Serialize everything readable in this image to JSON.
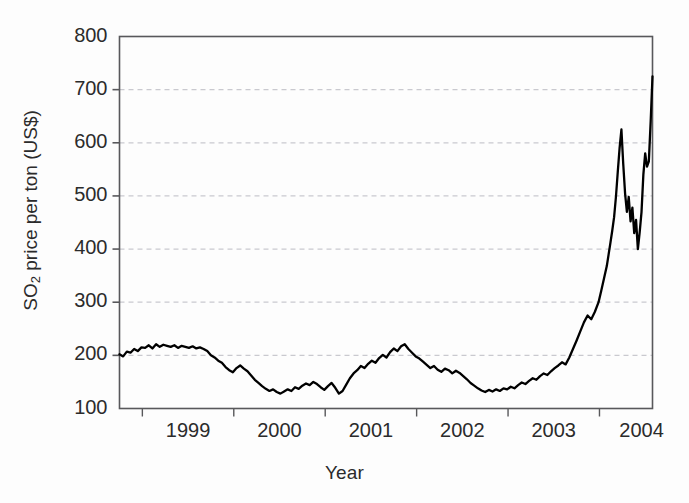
{
  "chart_data": {
    "type": "line",
    "title": "",
    "subtitle": "",
    "xlabel": "Year",
    "ylabel": "SO2 price per ton (US$)",
    "ylabel_parts": {
      "pre": "SO",
      "sub": "2",
      "post": " price per ton (US$)"
    },
    "xtick_labels": [
      "1999",
      "2000",
      "2001",
      "2002",
      "2003",
      "2004"
    ],
    "ytick_labels": [
      "100",
      "200",
      "300",
      "400",
      "500",
      "600",
      "700",
      "800"
    ],
    "ytick_values": [
      100,
      200,
      300,
      400,
      500,
      600,
      700,
      800
    ],
    "ylim": [
      100,
      800
    ],
    "xlim": [
      1998.75,
      2004.58
    ],
    "grid": "horizontal-dashed",
    "grid_values": [
      200,
      300,
      400,
      500,
      600,
      700
    ],
    "legend": "none",
    "series_name": "SO2 allowance price",
    "line_color": "#000000",
    "grid_color": "#c9c9cf",
    "axis_color": "#58585b",
    "x": [
      1998.75,
      1998.79,
      1998.83,
      1998.87,
      1998.91,
      1998.95,
      1998.99,
      1999.03,
      1999.07,
      1999.11,
      1999.15,
      1999.19,
      1999.23,
      1999.27,
      1999.31,
      1999.35,
      1999.39,
      1999.43,
      1999.47,
      1999.51,
      1999.55,
      1999.59,
      1999.63,
      1999.67,
      1999.71,
      1999.75,
      1999.79,
      1999.83,
      1999.87,
      1999.91,
      1999.95,
      1999.99,
      2000.03,
      2000.07,
      2000.11,
      2000.15,
      2000.19,
      2000.23,
      2000.27,
      2000.31,
      2000.35,
      2000.39,
      2000.43,
      2000.47,
      2000.51,
      2000.55,
      2000.59,
      2000.63,
      2000.67,
      2000.71,
      2000.75,
      2000.79,
      2000.83,
      2000.87,
      2000.91,
      2000.95,
      2000.99,
      2001.03,
      2001.07,
      2001.11,
      2001.15,
      2001.19,
      2001.23,
      2001.27,
      2001.31,
      2001.35,
      2001.39,
      2001.43,
      2001.47,
      2001.51,
      2001.55,
      2001.59,
      2001.63,
      2001.67,
      2001.71,
      2001.75,
      2001.79,
      2001.83,
      2001.87,
      2001.91,
      2001.95,
      2001.99,
      2002.03,
      2002.07,
      2002.11,
      2002.15,
      2002.19,
      2002.23,
      2002.27,
      2002.31,
      2002.35,
      2002.39,
      2002.43,
      2002.47,
      2002.51,
      2002.55,
      2002.59,
      2002.63,
      2002.67,
      2002.71,
      2002.75,
      2002.79,
      2002.83,
      2002.87,
      2002.91,
      2002.95,
      2002.99,
      2003.03,
      2003.07,
      2003.11,
      2003.15,
      2003.19,
      2003.23,
      2003.27,
      2003.31,
      2003.35,
      2003.39,
      2003.43,
      2003.47,
      2003.51,
      2003.55,
      2003.59,
      2003.63,
      2003.67,
      2003.71,
      2003.75,
      2003.79,
      2003.83,
      2003.87,
      2003.91,
      2003.95,
      2003.99,
      2004.02,
      2004.05,
      2004.08,
      2004.1,
      2004.12,
      2004.14,
      2004.16,
      2004.18,
      2004.2,
      2004.22,
      2004.24,
      2004.26,
      2004.28,
      2004.3,
      2004.32,
      2004.34,
      2004.36,
      2004.38,
      2004.4,
      2004.42,
      2004.44,
      2004.46,
      2004.48,
      2004.5,
      2004.52,
      2004.54,
      2004.56,
      2004.58
    ],
    "values": [
      202,
      198,
      207,
      205,
      212,
      208,
      215,
      214,
      219,
      213,
      221,
      216,
      220,
      218,
      216,
      219,
      214,
      218,
      216,
      214,
      217,
      213,
      215,
      212,
      208,
      200,
      196,
      190,
      186,
      178,
      172,
      168,
      176,
      181,
      175,
      170,
      162,
      154,
      148,
      142,
      137,
      133,
      136,
      131,
      128,
      132,
      136,
      133,
      140,
      137,
      143,
      147,
      144,
      150,
      146,
      140,
      135,
      142,
      148,
      139,
      128,
      133,
      145,
      157,
      166,
      172,
      180,
      176,
      184,
      190,
      186,
      195,
      201,
      196,
      206,
      213,
      208,
      217,
      221,
      212,
      205,
      198,
      194,
      188,
      182,
      176,
      180,
      173,
      169,
      175,
      172,
      166,
      171,
      167,
      161,
      155,
      148,
      143,
      138,
      134,
      131,
      135,
      132,
      136,
      133,
      138,
      136,
      141,
      138,
      144,
      149,
      146,
      152,
      157,
      154,
      161,
      166,
      163,
      170,
      176,
      181,
      187,
      183,
      196,
      212,
      228,
      245,
      262,
      275,
      268,
      282,
      300,
      322,
      345,
      368,
      390,
      412,
      435,
      460,
      498,
      545,
      590,
      625,
      560,
      505,
      470,
      498,
      452,
      478,
      430,
      455,
      400,
      432,
      470,
      540,
      580,
      555,
      565,
      640,
      725
    ]
  }
}
